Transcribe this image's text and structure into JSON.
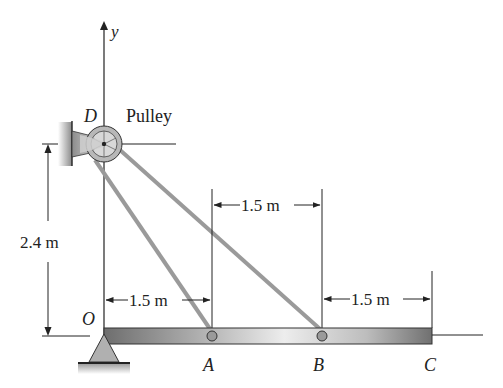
{
  "diagram": {
    "axis_label": "y",
    "points": {
      "D": "D",
      "O": "O",
      "A": "A",
      "B": "B",
      "C": "C"
    },
    "pulley_label": "Pulley",
    "dimensions": {
      "height": "2.4 m",
      "OA": "1.5 m",
      "AB": "1.5 m",
      "BC": "1.5 m"
    },
    "colors": {
      "line": "#222222",
      "cable": "#9a9a9a",
      "beam_dark": "#7a7a7a",
      "beam_light": "#e6e6e6",
      "support": "#a8a8a8"
    }
  }
}
